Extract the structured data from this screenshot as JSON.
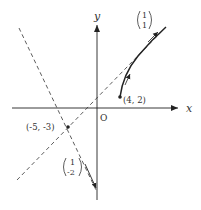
{
  "diagram": {
    "type": "coordinate-plane",
    "axes": {
      "x_label": "x",
      "y_label": "y",
      "origin_label": "O"
    },
    "points": [
      {
        "label": "(4, 2)",
        "x": 4,
        "y": 2
      },
      {
        "label": "(-5, -3)",
        "x": -5,
        "y": -3
      }
    ],
    "vectors": [
      {
        "top": "1",
        "bottom": "1",
        "description": "direction vector (1,1)"
      },
      {
        "top": "1",
        "bottom": "-2",
        "description": "direction vector (1,-2)"
      }
    ],
    "lines": [
      {
        "style": "dashed",
        "through": "(-5, -3)",
        "direction": "(1, 1)"
      },
      {
        "style": "dashed",
        "through": "(-5, -3)",
        "direction": "(1, -2)"
      }
    ],
    "curve": {
      "style": "solid",
      "start": "(4, 2)",
      "asymptotic_direction": "(1, 1)"
    },
    "colors": {
      "ink": "#222222",
      "label": "#333333",
      "background": "#ffffff"
    }
  }
}
